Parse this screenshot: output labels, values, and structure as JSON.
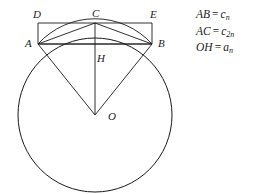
{
  "figure": {
    "background_color": "#ffffff",
    "stroke_color": "#1a1a1a",
    "labels": {
      "D": "D",
      "C": "C",
      "E": "E",
      "A": "A",
      "B": "B",
      "H": "H",
      "O": "O"
    },
    "points": {
      "A": {
        "x": 38,
        "y": 44
      },
      "B": {
        "x": 152,
        "y": 44
      },
      "C": {
        "x": 95,
        "y": 23
      },
      "D": {
        "x": 38,
        "y": 23
      },
      "E": {
        "x": 152,
        "y": 23
      },
      "H": {
        "x": 95,
        "y": 44
      },
      "O": {
        "x": 95,
        "y": 115
      }
    },
    "circle": {
      "center_x": 95,
      "center_y": 115,
      "radius": 77
    }
  },
  "equations": [
    {
      "lhs": "AB",
      "rel": "=",
      "rhs": "c",
      "sub": "n"
    },
    {
      "lhs": "AC",
      "rel": "=",
      "rhs": "c",
      "sub": "2n"
    },
    {
      "lhs": "OH",
      "rel": "=",
      "rhs": "a",
      "sub": "n"
    }
  ]
}
